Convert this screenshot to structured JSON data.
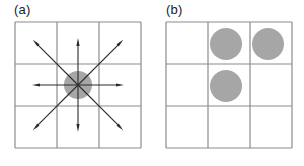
{
  "figure": {
    "width": 304,
    "height": 166,
    "background": "#ffffff"
  },
  "panels": [
    {
      "id": "a",
      "label": "(a)",
      "grid": {
        "x": 15,
        "y": 22,
        "size": 126,
        "rows": 3,
        "cols": 3,
        "line_color": "#8c8c8c",
        "line_width": 1.2
      },
      "circles": [
        {
          "name": "center-blob",
          "cx": 78,
          "cy": 85,
          "r": 14,
          "fill": "#a6a6a6"
        }
      ],
      "arrows": {
        "color": "#2b2b2b",
        "width": 1.1,
        "origin": {
          "x": 78,
          "y": 85
        },
        "head_length": 8,
        "head_width": 3.2,
        "directions": [
          {
            "name": "arrow-up",
            "dx": 0,
            "dy": -1,
            "length": 47
          },
          {
            "name": "arrow-down",
            "dx": 0,
            "dy": 1,
            "length": 47
          },
          {
            "name": "arrow-left",
            "dx": -1,
            "dy": 0,
            "length": 46
          },
          {
            "name": "arrow-right",
            "dx": 1,
            "dy": 0,
            "length": 46
          },
          {
            "name": "arrow-up-left",
            "dx": -1,
            "dy": -1,
            "length": 64
          },
          {
            "name": "arrow-up-right",
            "dx": 1,
            "dy": -1,
            "length": 64
          },
          {
            "name": "arrow-down-left",
            "dx": -1,
            "dy": 1,
            "length": 64
          },
          {
            "name": "arrow-down-right",
            "dx": 1,
            "dy": 1,
            "length": 64
          }
        ]
      }
    },
    {
      "id": "b",
      "label": "(b)",
      "grid": {
        "x": 14,
        "y": 22,
        "size": 126,
        "rows": 3,
        "cols": 3,
        "line_color": "#8c8c8c",
        "line_width": 1.2
      },
      "circles": [
        {
          "name": "blob-row0-col1",
          "cx": 74,
          "cy": 44,
          "r": 16,
          "fill": "#a6a6a6",
          "cell": [
            0,
            1
          ]
        },
        {
          "name": "blob-row0-col2",
          "cx": 116,
          "cy": 44,
          "r": 16,
          "fill": "#a6a6a6",
          "cell": [
            0,
            2
          ]
        },
        {
          "name": "blob-row1-col1",
          "cx": 74,
          "cy": 86,
          "r": 16,
          "fill": "#a6a6a6",
          "cell": [
            1,
            1
          ]
        }
      ],
      "arrows": null
    }
  ],
  "chart_data": {
    "type": "diagram",
    "title": "",
    "panels": [
      {
        "label": "(a)",
        "grid_rows": 3,
        "grid_cols": 3,
        "occupied_cells": [
          [
            1,
            1
          ]
        ],
        "arrow_directions": [
          "up",
          "down",
          "left",
          "right",
          "up-left",
          "up-right",
          "down-left",
          "down-right"
        ],
        "arrow_count": 8
      },
      {
        "label": "(b)",
        "grid_rows": 3,
        "grid_cols": 3,
        "occupied_cells": [
          [
            0,
            1
          ],
          [
            0,
            2
          ],
          [
            1,
            1
          ]
        ],
        "arrow_directions": [],
        "arrow_count": 0
      }
    ]
  }
}
